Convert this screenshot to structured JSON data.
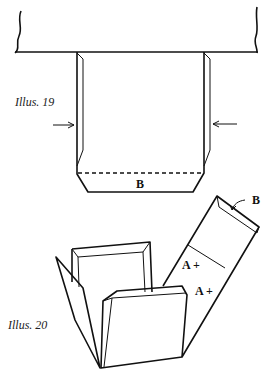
{
  "figures": [
    {
      "caption": "Illus. 19",
      "labels": {
        "bottom_fold": "B"
      }
    },
    {
      "caption": "Illus. 20",
      "labels": {
        "strip_end": "B",
        "mark_upper": "A +",
        "mark_lower": "A +"
      }
    }
  ],
  "colors": {
    "ink": "#111111",
    "paper": "#ffffff"
  }
}
